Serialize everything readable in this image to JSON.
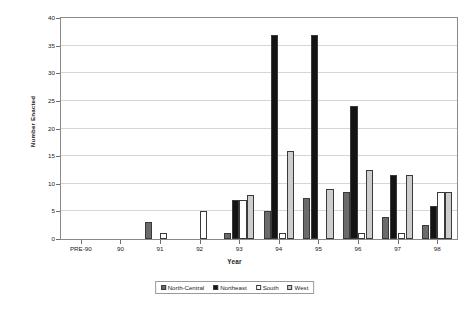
{
  "chart_data": {
    "type": "bar",
    "title": "",
    "xlabel": "Year",
    "ylabel": "Number Enacted",
    "ylim": [
      0,
      40
    ],
    "ytick_step": 5,
    "yticks": [
      0,
      5,
      10,
      15,
      20,
      25,
      30,
      35,
      40
    ],
    "grid": true,
    "legend_position": "bottom",
    "categories": [
      "PRE-90",
      "90",
      "91",
      "92",
      "93",
      "94",
      "95",
      "96",
      "97",
      "98"
    ],
    "series": [
      {
        "name": "North-Central",
        "color": "#6b6b6b",
        "values": [
          0,
          0,
          3,
          0,
          1,
          5,
          7.5,
          8.5,
          4,
          2.5
        ]
      },
      {
        "name": "Northeast",
        "color": "#141414",
        "values": [
          0,
          0,
          0,
          0,
          7,
          37,
          37,
          24,
          11.5,
          6
        ]
      },
      {
        "name": "South",
        "color": "#ffffff",
        "values": [
          0,
          0,
          1,
          5,
          7,
          1,
          0,
          1,
          1,
          8.5
        ]
      },
      {
        "name": "West",
        "color": "#cdcdcd",
        "values": [
          0,
          0,
          0,
          0,
          8,
          16,
          9,
          12.5,
          11.5,
          8.5
        ]
      }
    ]
  },
  "legend": {
    "items": [
      {
        "label": "North-Central"
      },
      {
        "label": "Northeast"
      },
      {
        "label": "South"
      },
      {
        "label": "West"
      }
    ]
  }
}
